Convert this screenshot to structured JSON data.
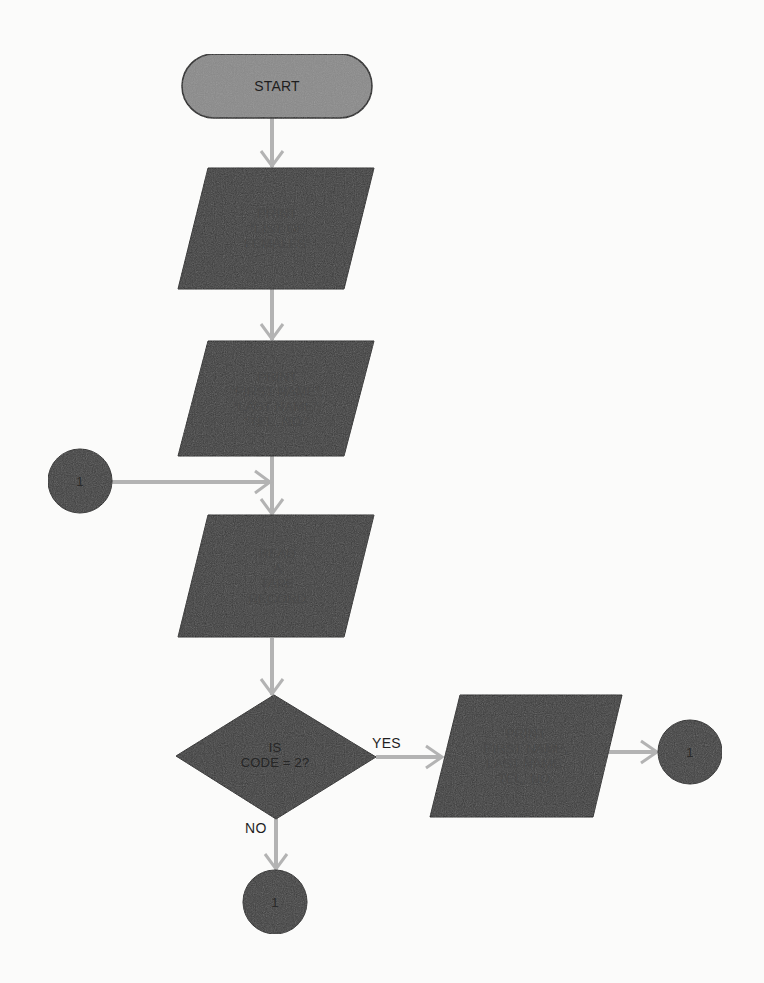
{
  "diagram": {
    "type": "flowchart",
    "colors": {
      "background": "#fbfbfa",
      "terminator_fill": "#8a8a8a",
      "process_fill": "#3a3a3a",
      "connector_fill": "#3c3c3c",
      "outline": "#1a1a1a",
      "arrow": "#b3b3b3",
      "text_dark": "#2b2b2b",
      "text_on_dark": "#4a4a4a"
    },
    "nodes": [
      {
        "id": "start",
        "shape": "terminator",
        "lines": [
          "START"
        ]
      },
      {
        "id": "print_title",
        "shape": "parallelogram",
        "lines": [
          "PRINT",
          "“LIST OF",
          "FEMALES”"
        ]
      },
      {
        "id": "print_headers",
        "shape": "parallelogram",
        "lines": [
          "PRINT",
          "“FIRST NAME”,",
          "“LAST NAME”,",
          "“TEL. NO.”"
        ]
      },
      {
        "id": "connector_left",
        "shape": "connector",
        "lines": [
          "1"
        ]
      },
      {
        "id": "read_record",
        "shape": "parallelogram",
        "lines": [
          "READ",
          "A",
          "TAPE",
          "RECORD"
        ]
      },
      {
        "id": "decision_code",
        "shape": "diamond",
        "lines": [
          "IS",
          "CODE = 2?"
        ]
      },
      {
        "id": "print_record",
        "shape": "parallelogram",
        "lines": [
          "PRINT",
          "FIRST NAME,",
          "LAST NAME,",
          "TEL. NO."
        ]
      },
      {
        "id": "connector_right",
        "shape": "connector",
        "lines": [
          "1"
        ]
      },
      {
        "id": "connector_bottom",
        "shape": "connector",
        "lines": [
          "1"
        ]
      }
    ],
    "edges": [
      {
        "from": "start",
        "to": "print_title",
        "label": ""
      },
      {
        "from": "print_title",
        "to": "print_headers",
        "label": ""
      },
      {
        "from": "print_headers",
        "to": "read_record",
        "label": ""
      },
      {
        "from": "connector_left",
        "to": "read_record",
        "label": ""
      },
      {
        "from": "read_record",
        "to": "decision_code",
        "label": ""
      },
      {
        "from": "decision_code",
        "to": "print_record",
        "label": "YES"
      },
      {
        "from": "print_record",
        "to": "connector_right",
        "label": ""
      },
      {
        "from": "decision_code",
        "to": "connector_bottom",
        "label": "NO"
      }
    ],
    "labels": {
      "start": "START",
      "print_title": [
        "PRINT",
        "“LIST OF",
        "FEMALES”"
      ],
      "print_headers": [
        "PRINT",
        "“FIRST NAME”,",
        "“LAST NAME”,",
        "“TEL. NO.”"
      ],
      "read_record": [
        "READ",
        "A",
        "TAPE",
        "RECORD"
      ],
      "decision": [
        "IS",
        "CODE = 2?"
      ],
      "print_record": [
        "PRINT",
        "FIRST NAME,",
        "LAST NAME,",
        "TEL. NO."
      ],
      "connector": "1",
      "yes": "YES",
      "no": "NO"
    }
  }
}
